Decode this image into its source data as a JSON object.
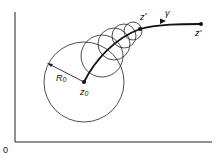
{
  "diagram": {
    "origin_label": "0",
    "center_label": "z",
    "center_sub": "0",
    "radius_label": "R",
    "radius_sub": "0",
    "path_label": "γ",
    "zstar_label": "z",
    "zstar_sup": "*",
    "zprime_label": "z'",
    "stroke_color": "#1a1a1a"
  }
}
